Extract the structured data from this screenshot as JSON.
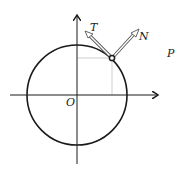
{
  "diagram": {
    "type": "unit-circle-tangent-normal",
    "labels": {
      "origin": "O",
      "tangent": "T",
      "normal": "N",
      "point": "P"
    },
    "colors": {
      "stroke": "#1a1a1a",
      "projection": "#cfcfcf",
      "vector_fill": "#ffffff",
      "vector_stroke": "#555555"
    }
  }
}
